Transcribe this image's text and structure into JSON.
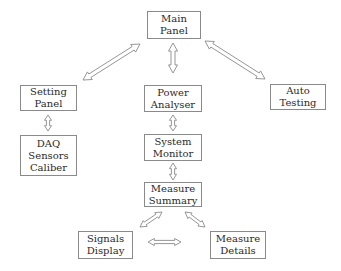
{
  "diagram": {
    "nodes": [
      {
        "id": "main-panel",
        "lines": [
          "Main",
          "Panel"
        ],
        "x": 147,
        "y": 11,
        "w": 54,
        "h": 28
      },
      {
        "id": "setting-panel",
        "lines": [
          "Setting",
          "Panel"
        ],
        "x": 20,
        "y": 85,
        "w": 57,
        "h": 26
      },
      {
        "id": "daq-sensors-caliber",
        "lines": [
          "DAQ",
          "Sensors",
          "Caliber"
        ],
        "x": 20,
        "y": 135,
        "w": 57,
        "h": 41
      },
      {
        "id": "power-analyser",
        "lines": [
          "Power",
          "Analyser"
        ],
        "x": 144,
        "y": 85,
        "w": 58,
        "h": 27
      },
      {
        "id": "auto-testing",
        "lines": [
          "Auto",
          "Testing"
        ],
        "x": 270,
        "y": 84,
        "w": 56,
        "h": 26
      },
      {
        "id": "system-monitor",
        "lines": [
          "System",
          "Monitor"
        ],
        "x": 144,
        "y": 134,
        "w": 58,
        "h": 27
      },
      {
        "id": "measure-summary",
        "lines": [
          "Measure",
          "Summary"
        ],
        "x": 144,
        "y": 182,
        "w": 58,
        "h": 25
      },
      {
        "id": "signals-display",
        "lines": [
          "Signals",
          "Display"
        ],
        "x": 78,
        "y": 231,
        "w": 55,
        "h": 28
      },
      {
        "id": "measure-details",
        "lines": [
          "Measure",
          "Details"
        ],
        "x": 210,
        "y": 231,
        "w": 56,
        "h": 28
      }
    ],
    "arrows": [
      {
        "id": "main-power",
        "from": [
          173,
          43
        ],
        "to": [
          173,
          73
        ],
        "width": 9
      },
      {
        "id": "main-setting",
        "from": [
          140,
          44
        ],
        "to": [
          83,
          80
        ],
        "width": 9
      },
      {
        "id": "main-auto",
        "from": [
          205,
          41
        ],
        "to": [
          265,
          79
        ],
        "width": 9
      },
      {
        "id": "setting-daq",
        "from": [
          48,
          115
        ],
        "to": [
          48,
          131
        ],
        "width": 7
      },
      {
        "id": "power-system",
        "from": [
          173,
          115
        ],
        "to": [
          173,
          131
        ],
        "width": 7
      },
      {
        "id": "system-summary",
        "from": [
          173,
          163
        ],
        "to": [
          173,
          180
        ],
        "width": 7
      },
      {
        "id": "summary-signals",
        "from": [
          162,
          212
        ],
        "to": [
          140,
          227
        ],
        "width": 7
      },
      {
        "id": "summary-details",
        "from": [
          185,
          212
        ],
        "to": [
          205,
          227
        ],
        "width": 7
      },
      {
        "id": "signals-details",
        "from": [
          148,
          242
        ],
        "to": [
          181,
          242
        ],
        "width": 7
      }
    ],
    "stroke_color": "#8a8a8a"
  }
}
